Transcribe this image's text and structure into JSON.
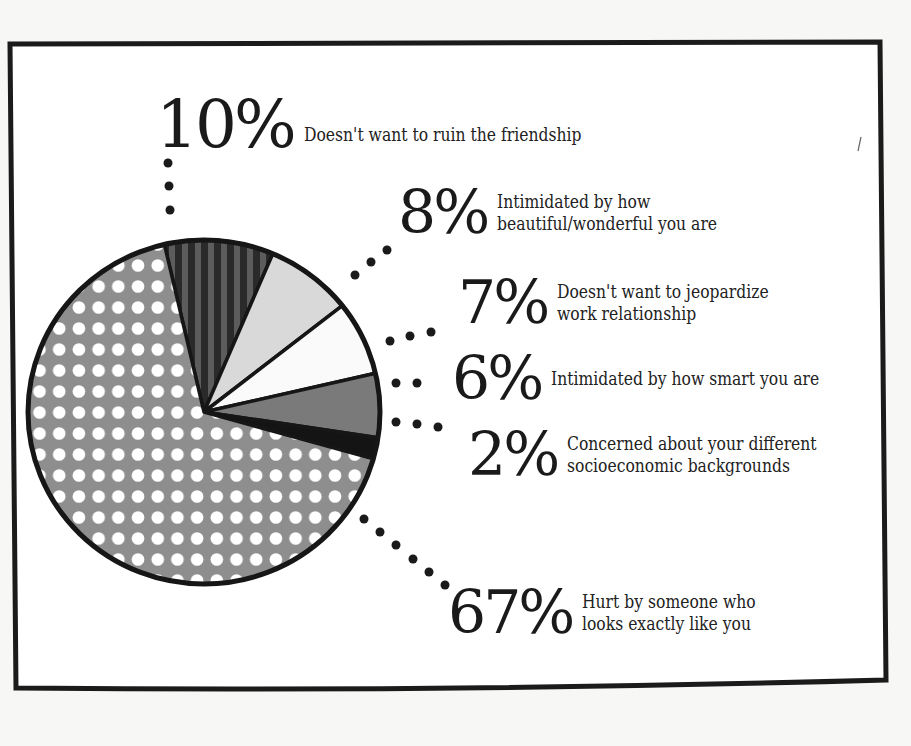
{
  "chart_data": {
    "type": "pie",
    "title": "",
    "slices": [
      {
        "label": "Doesn't want to ruin the friendship",
        "value": 10,
        "pct_text": "10%",
        "lines": [
          "Doesn't want to ruin the friendship"
        ],
        "fill": "striped-dark"
      },
      {
        "label": "Intimidated by how beautiful/wonderful you are",
        "value": 8,
        "pct_text": "8%",
        "lines": [
          "Intimidated by how",
          "beautiful/wonderful you are"
        ],
        "fill": "light-gray"
      },
      {
        "label": "Doesn't want to jeopardize work relationship",
        "value": 7,
        "pct_text": "7%",
        "lines": [
          "Doesn't want to jeopardize",
          "work relationship"
        ],
        "fill": "white"
      },
      {
        "label": "Intimidated by how smart you are",
        "value": 6,
        "pct_text": "6%",
        "lines": [
          "Intimidated by how smart you are"
        ],
        "fill": "mid-gray"
      },
      {
        "label": "Concerned about your different socioeconomic backgrounds",
        "value": 2,
        "pct_text": "2%",
        "lines": [
          "Concerned about your different",
          "socioeconomic backgrounds"
        ],
        "fill": "black"
      },
      {
        "label": "Hurt by someone who looks exactly like you",
        "value": 67,
        "pct_text": "67%",
        "lines": [
          "Hurt by someone who",
          "looks exactly like you"
        ],
        "fill": "gray-polka-dot"
      }
    ],
    "legend_position": "callout labels with dotted leaders",
    "colors": {
      "striped_dark": "#2e2e2e",
      "stripe_light": "#5a5a5a",
      "light_gray": "#d9d9d9",
      "white": "#fafafa",
      "mid_gray": "#7a7a7a",
      "black": "#141414",
      "dotted_bg": "#8c8c8c",
      "dot": "#ffffff",
      "outline": "#161616"
    }
  }
}
